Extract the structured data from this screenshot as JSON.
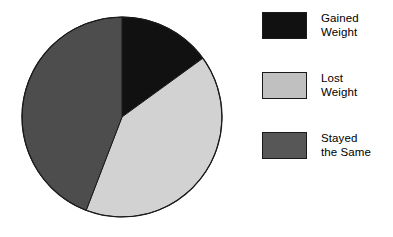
{
  "chart_data": {
    "type": "pie",
    "title": "",
    "subtitle": "",
    "xlabel": "",
    "ylabel": "",
    "grid": false,
    "legend_position": "right",
    "start_angle_deg": 0,
    "direction": "clockwise",
    "center": {
      "x": 122,
      "y": 117
    },
    "radius": 100,
    "categories": [
      "Gained Weight",
      "Lost Weight",
      "Stayed the Same"
    ],
    "values": [
      15,
      41,
      44
    ],
    "value_unit": "percent",
    "colors": [
      "#111111",
      "#d2d2d2",
      "#4d4d4d"
    ],
    "slices": [
      {
        "label": "Gained Weight",
        "label_line1": "Gained",
        "label_line2": "Weight",
        "value": 15,
        "start_angle_deg": 0,
        "end_angle_deg": 54,
        "color": "#111111"
      },
      {
        "label": "Lost Weight",
        "label_line1": "Lost",
        "label_line2": "Weight",
        "value": 41,
        "start_angle_deg": 54,
        "end_angle_deg": 201,
        "color": "#d2d2d2"
      },
      {
        "label": "Stayed the Same",
        "label_line1": "Stayed",
        "label_line2": "the Same",
        "value": 44,
        "start_angle_deg": 201,
        "end_angle_deg": 360,
        "color": "#4d4d4d"
      }
    ]
  },
  "legend": {
    "items": [
      {
        "label": "Gained\nWeight",
        "swatch_color": "#111111"
      },
      {
        "label": "Lost\nWeight",
        "swatch_color": "#c0c0c0"
      },
      {
        "label": "Stayed\nthe Same",
        "swatch_color": "#575757"
      }
    ]
  },
  "style": {
    "background": "#ffffff",
    "outline_color": "#1a1a1a",
    "text_color": "#000000"
  }
}
